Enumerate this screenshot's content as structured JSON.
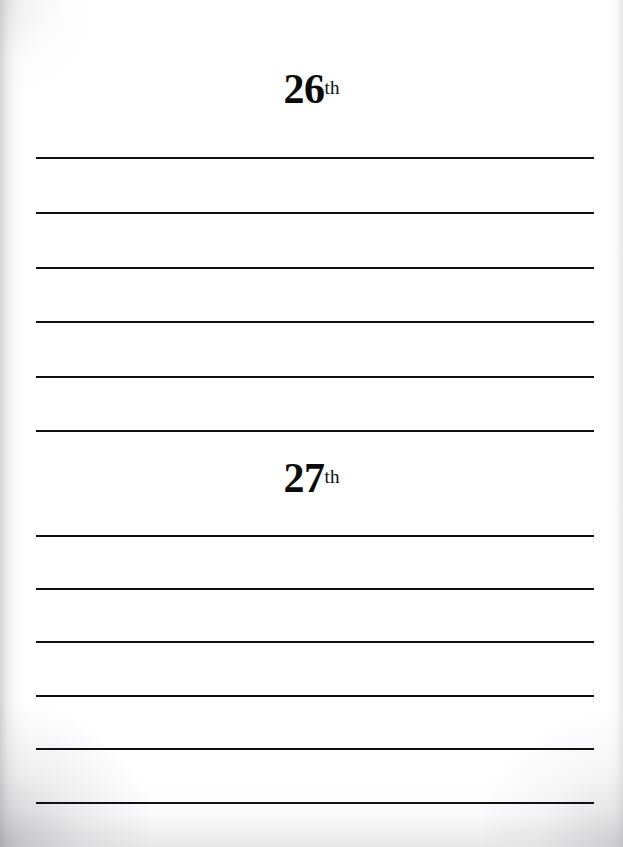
{
  "page": {
    "type": "journal-page",
    "background_color": "#ffffff",
    "width": 623,
    "height": 847
  },
  "entries": [
    {
      "id": "entry-26",
      "day_number": "26",
      "ordinal_suffix": "th",
      "heading_top": 68,
      "line_count": 6,
      "line_positions": [
        157,
        212,
        267,
        321,
        376,
        430
      ]
    },
    {
      "id": "entry-27",
      "day_number": "27",
      "ordinal_suffix": "th",
      "heading_top": 457,
      "line_count": 6,
      "line_positions": [
        535,
        588,
        641,
        695,
        748,
        802
      ]
    }
  ],
  "rules": {
    "left": 36,
    "width": 558,
    "thickness": 2,
    "color": "#111115"
  },
  "colors": {
    "ink": "#0b0b0b",
    "rule": "#111115",
    "paper": "#ffffff",
    "edge_shadow": "#969698"
  }
}
